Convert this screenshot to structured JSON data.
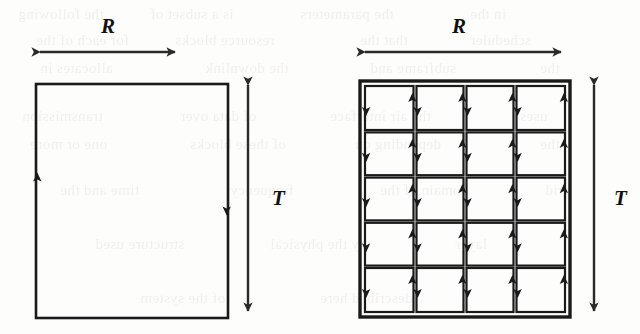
{
  "figure": {
    "background_color": "#fdfdfc",
    "ink_color": "#1a1a1a",
    "panels": [
      {
        "id": "panel-left",
        "name": "undivided-resource-block",
        "width_label": "R",
        "height_label": "T",
        "rect": {
          "x": 36,
          "y": 84,
          "width": 192,
          "height": 234
        },
        "columns": 1,
        "rows": 1,
        "edge_arrows": [
          {
            "edge": "left",
            "direction": "up"
          },
          {
            "edge": "right",
            "direction": "down"
          }
        ]
      },
      {
        "id": "panel-right",
        "name": "subdivided-resource-grid",
        "width_label": "R",
        "height_label": "T",
        "rect": {
          "x": 360,
          "y": 81,
          "width": 210,
          "height": 236
        },
        "columns": 4,
        "rows": 5,
        "cell_count": 20,
        "edge_arrows": [
          {
            "edge": "left",
            "direction": "down"
          },
          {
            "edge": "right",
            "direction": "up"
          }
        ]
      }
    ],
    "dimension_arrows": [
      {
        "name": "width-arrow-left",
        "label": "R",
        "orientation": "horizontal",
        "x1": 33,
        "x2": 182,
        "y": 52,
        "label_x": 101,
        "label_y": 14
      },
      {
        "name": "height-arrow-left",
        "label": "T",
        "orientation": "vertical",
        "y1": 78,
        "y2": 318,
        "x": 248,
        "label_x": 272,
        "label_y": 186
      },
      {
        "name": "width-arrow-right",
        "label": "R",
        "orientation": "horizontal",
        "x1": 358,
        "x2": 568,
        "y": 52,
        "label_x": 452,
        "label_y": 14
      },
      {
        "name": "height-arrow-right",
        "label": "T",
        "orientation": "vertical",
        "y1": 78,
        "y2": 318,
        "x": 594,
        "label_x": 614,
        "label_y": 186
      }
    ],
    "bleed_through_text": [
      {
        "text": "the following",
        "x": 18,
        "y": 6
      },
      {
        "text": "is a subset of",
        "x": 150,
        "y": 6
      },
      {
        "text": "the parameters",
        "x": 300,
        "y": 6
      },
      {
        "text": "in the",
        "x": 470,
        "y": 6
      },
      {
        "text": "for each of the",
        "x": 36,
        "y": 32
      },
      {
        "text": "resource blocks",
        "x": 175,
        "y": 32
      },
      {
        "text": "that the",
        "x": 360,
        "y": 32
      },
      {
        "text": "scheduler",
        "x": 470,
        "y": 32
      },
      {
        "text": "allocates in",
        "x": 40,
        "y": 60
      },
      {
        "text": "the downlink",
        "x": 205,
        "y": 60
      },
      {
        "text": "subframe and",
        "x": 370,
        "y": 60
      },
      {
        "text": "the",
        "x": 540,
        "y": 60
      },
      {
        "text": "transmission",
        "x": 22,
        "y": 108
      },
      {
        "text": "of data over",
        "x": 180,
        "y": 108
      },
      {
        "text": "the air interface",
        "x": 330,
        "y": 108
      },
      {
        "text": "uses",
        "x": 520,
        "y": 108
      },
      {
        "text": "one or more",
        "x": 30,
        "y": 136
      },
      {
        "text": "of these blocks",
        "x": 190,
        "y": 136
      },
      {
        "text": "depending on",
        "x": 355,
        "y": 136
      },
      {
        "text": "the",
        "x": 540,
        "y": 136
      },
      {
        "text": "time and the",
        "x": 60,
        "y": 182
      },
      {
        "text": "frequency",
        "x": 230,
        "y": 182
      },
      {
        "text": "domain of the",
        "x": 380,
        "y": 182
      },
      {
        "text": "grid",
        "x": 545,
        "y": 182
      },
      {
        "text": "structure used",
        "x": 95,
        "y": 236
      },
      {
        "text": "by the physical",
        "x": 270,
        "y": 236
      },
      {
        "text": "layer",
        "x": 455,
        "y": 236
      },
      {
        "text": "of the system",
        "x": 140,
        "y": 290
      },
      {
        "text": "described here",
        "x": 320,
        "y": 290
      }
    ]
  }
}
